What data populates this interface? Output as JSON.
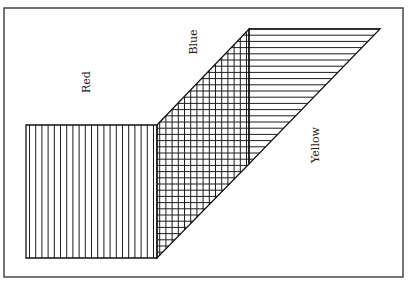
{
  "diagram": {
    "type": "region-overlap",
    "frame": {
      "x": 4,
      "y": 8,
      "width": 399,
      "height": 269
    },
    "regions": [
      {
        "id": "red",
        "label": "Red",
        "pattern": "vertical-lines",
        "shape": [
          [
            26,
            125
          ],
          [
            157,
            125
          ],
          [
            157,
            258
          ],
          [
            26,
            258
          ]
        ]
      },
      {
        "id": "blue",
        "label": "Blue",
        "pattern": "crosshatch",
        "shape": [
          [
            157,
            125
          ],
          [
            249,
            29
          ],
          [
            249,
            164
          ],
          [
            157,
            258
          ]
        ]
      },
      {
        "id": "yellow",
        "label": "Yellow",
        "pattern": "horizontal-lines",
        "shape": [
          [
            249,
            29
          ],
          [
            380,
            29
          ],
          [
            249,
            164
          ]
        ]
      }
    ],
    "labels": [
      {
        "text": "Red",
        "x": 90,
        "y": 82,
        "rotate": -90
      },
      {
        "text": "Blue",
        "x": 197,
        "y": 42,
        "rotate": -90
      },
      {
        "text": "Yellow",
        "x": 319,
        "y": 145,
        "rotate": -90
      }
    ],
    "hatch": {
      "spacing": 6.2,
      "vertical_x_start": 29.5,
      "vertical_x_end": 249,
      "horizontal_y_start": 29,
      "horizontal_y_end": 258
    }
  }
}
